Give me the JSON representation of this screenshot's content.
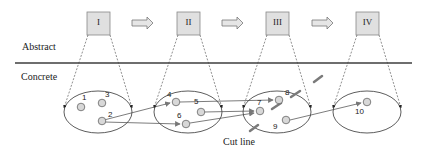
{
  "labels": {
    "abstract": "Abstract",
    "concrete": "Concrete",
    "cut_line": "Cut line"
  },
  "abstract_states": [
    {
      "label": "I",
      "x": 87,
      "y": 12
    },
    {
      "label": "II",
      "x": 177,
      "y": 12
    },
    {
      "label": "III",
      "x": 266,
      "y": 12
    },
    {
      "label": "IV",
      "x": 356,
      "y": 12
    }
  ],
  "nodes": [
    {
      "id": "1",
      "x": 81,
      "y": 107
    },
    {
      "id": "3",
      "x": 102,
      "y": 103
    },
    {
      "id": "2",
      "x": 102,
      "y": 121
    },
    {
      "id": "4",
      "x": 176,
      "y": 102
    },
    {
      "id": "5",
      "x": 201,
      "y": 112
    },
    {
      "id": "6",
      "x": 186,
      "y": 124
    },
    {
      "id": "7",
      "x": 260,
      "y": 111
    },
    {
      "id": "8",
      "x": 279,
      "y": 100
    },
    {
      "id": "9",
      "x": 286,
      "y": 120
    },
    {
      "id": "10",
      "x": 367,
      "y": 102
    }
  ],
  "colors": {
    "box_fill": "#e0e0e0",
    "node_fill": "#d8d8d8",
    "separator": "#6e6e6e",
    "cut": "#7a7a7a",
    "line": "#333333"
  }
}
